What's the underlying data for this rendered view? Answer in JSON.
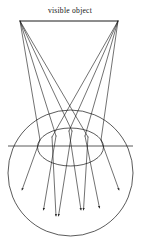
{
  "figure": {
    "background_color": "#ffffff",
    "stroke_color": "#1a1a1a",
    "width": 141,
    "height": 244
  },
  "labels": {
    "object_label": "visible object",
    "object_label_x": 70,
    "object_label_y": 12
  },
  "object": {
    "name": "visible object",
    "left_point": {
      "x": 20,
      "y": 21
    },
    "right_point": {
      "x": 118,
      "y": 21
    }
  },
  "eye": {
    "name": "eyeball",
    "center_x": 70.5,
    "center_y": 173,
    "radius_x": 62.5,
    "radius_y": 63
  },
  "lens": {
    "name": "lens",
    "center_x": 70.5,
    "center_y": 147,
    "radius_x": 33,
    "radius_y": 19
  },
  "optical_axis": {
    "name": "optical axis",
    "x1": 8,
    "x2": 133,
    "y": 146
  },
  "rays": [
    {
      "id": "L1",
      "origin": "left",
      "points": "20,21 40,140 20,192"
    },
    {
      "id": "L2",
      "origin": "left",
      "points": "20,21 56,136 42,212"
    },
    {
      "id": "L3",
      "origin": "left",
      "points": "20,21 72,131 57,218"
    },
    {
      "id": "L4",
      "origin": "left",
      "points": "20,21 88,137 82,212"
    },
    {
      "id": "R1",
      "origin": "right",
      "points": "118,21 101,140 121,192"
    },
    {
      "id": "R2",
      "origin": "right",
      "points": "118,21 85,136 98,210"
    },
    {
      "id": "R3",
      "origin": "right",
      "points": "118,21 69,131 82,212"
    },
    {
      "id": "R4",
      "origin": "right",
      "points": "118,21 52,137 57,218"
    }
  ],
  "arrow_tips": [
    {
      "id": "A1",
      "x": 20,
      "y": 192,
      "angle": 118
    },
    {
      "id": "A2",
      "x": 42,
      "y": 212,
      "angle": 100
    },
    {
      "id": "A3",
      "x": 57,
      "y": 218,
      "angle": 97
    },
    {
      "id": "A4",
      "x": 82,
      "y": 212,
      "angle": 83
    },
    {
      "id": "A5",
      "x": 98,
      "y": 210,
      "angle": 80
    },
    {
      "id": "A6",
      "x": 121,
      "y": 192,
      "angle": 62
    }
  ]
}
